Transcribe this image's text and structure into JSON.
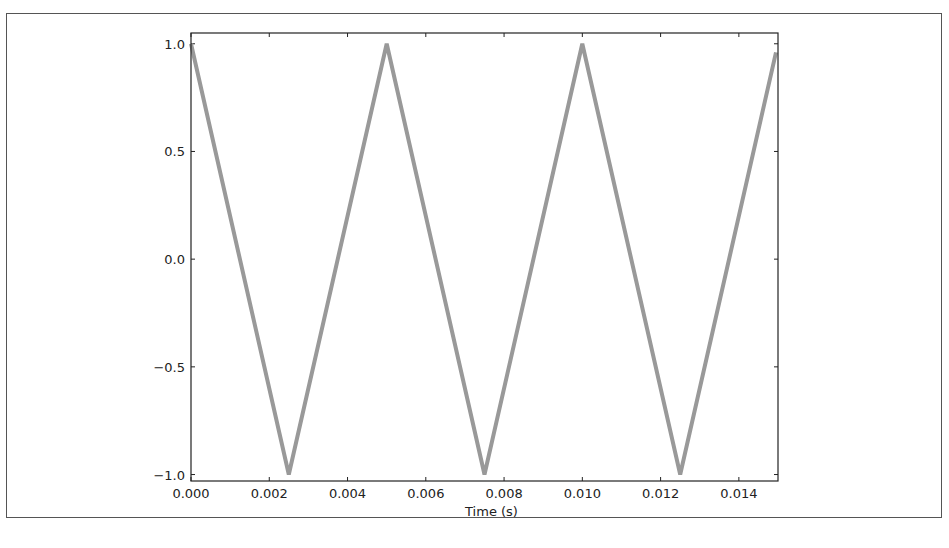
{
  "chart_data": {
    "type": "line",
    "title": "",
    "xlabel": "Time (s)",
    "ylabel": "",
    "xlim": [
      0.0,
      0.015
    ],
    "ylim": [
      -1.03,
      1.05
    ],
    "grid": false,
    "legend": null,
    "x_ticks": [
      0.0,
      0.002,
      0.004,
      0.006,
      0.008,
      0.01,
      0.012,
      0.014
    ],
    "x_tick_labels": [
      "0.000",
      "0.002",
      "0.004",
      "0.006",
      "0.008",
      "0.010",
      "0.012",
      "0.014"
    ],
    "y_ticks": [
      1.0,
      0.5,
      0.0,
      -0.5,
      -1.0
    ],
    "y_tick_labels": [
      "1.0",
      "0.5",
      "0.0",
      "−0.5",
      "−1.0"
    ],
    "series": [
      {
        "name": "triangle wave",
        "color": "#999999",
        "x": [
          0.0,
          0.0025,
          0.005,
          0.0075,
          0.01,
          0.0125,
          0.01495
        ],
        "y": [
          1.0,
          -1.0,
          1.0,
          -1.0,
          1.0,
          -1.0,
          0.96
        ]
      }
    ]
  }
}
